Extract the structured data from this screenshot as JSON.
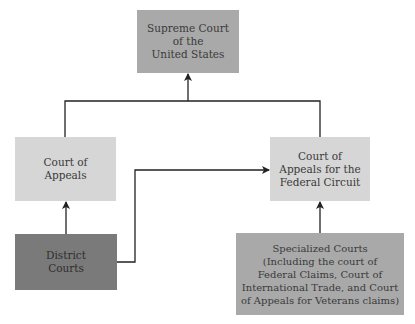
{
  "diagram": {
    "nodes": {
      "supreme_court": {
        "label": "Supreme Court\nof the\nUnited States",
        "color": "#a9a9a9"
      },
      "court_of_appeals": {
        "label": "Court of\nAppeals",
        "color": "#d6d6d6"
      },
      "federal_circuit": {
        "label": "Court of\nAppeals for the\nFederal Circuit",
        "color": "#d6d6d6"
      },
      "district_courts": {
        "label": "District\nCourts",
        "color": "#7a7a7a"
      },
      "specialized_courts": {
        "label": "Specialized Courts\n(Including the court of\nFederal Claims, Court of\nInternational Trade, and Court\nof Appeals for Veterans claims)",
        "color": "#a9a9a9"
      }
    },
    "edges": [
      {
        "from": "district_courts",
        "to": "court_of_appeals"
      },
      {
        "from": "district_courts",
        "to": "federal_circuit"
      },
      {
        "from": "specialized_courts",
        "to": "federal_circuit"
      },
      {
        "from": "court_of_appeals",
        "to": "supreme_court"
      },
      {
        "from": "federal_circuit",
        "to": "supreme_court"
      }
    ]
  }
}
